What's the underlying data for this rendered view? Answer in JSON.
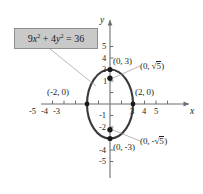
{
  "figure": {
    "type": "graph",
    "equation_box": {
      "text": "9x² + 4y² = 36",
      "coefficient_x": 9,
      "coefficient_y": 4,
      "constant": 36,
      "fill_color": "#c9c9c9",
      "border_color": "#8f8f8f"
    },
    "axes": {
      "x_label": "x",
      "y_label": "y",
      "x_ticks": [
        "-5",
        "-4",
        "-3",
        "3",
        "4",
        "5"
      ],
      "y_ticks_positive": [
        "5",
        "4",
        "2",
        "1"
      ],
      "y_ticks_negative": [
        "-1",
        "-2",
        "-4",
        "-5"
      ],
      "x_range": [
        -5.8,
        5.8
      ],
      "y_range": [
        -5.8,
        5.8
      ],
      "origin_px": [
        110,
        104
      ],
      "unit_px": 11.5,
      "axis_color": "#6d6e71"
    },
    "curve": {
      "shape": "ellipse",
      "semi_axis_x": 2,
      "semi_axis_y": 3,
      "color": "#3a3a3a",
      "line_width": 2.1
    },
    "point_labels": [
      {
        "name": "top-vertex",
        "text": "(0, 3)",
        "x": 0,
        "y": 3
      },
      {
        "name": "bottom-vertex",
        "text": "(0, -3)",
        "x": 0,
        "y": -3
      },
      {
        "name": "left-vertex",
        "text": "(-2, 0)",
        "x": -2,
        "y": 0
      },
      {
        "name": "right-vertex",
        "text": "(2, 0)",
        "x": 2,
        "y": 0
      }
    ],
    "focus_labels": [
      {
        "name": "upper-focus",
        "prefix": "(0, ",
        "radical": "5",
        "suffix": ")",
        "sign": "",
        "x": 0,
        "y": 2.236
      },
      {
        "name": "lower-focus",
        "prefix": "(0, ",
        "radical": "5",
        "suffix": ")",
        "sign": "-",
        "x": 0,
        "y": -2.236
      }
    ],
    "focus_dots": [
      {
        "x": 0,
        "y": 2.236
      },
      {
        "x": 0,
        "y": -2.236
      }
    ],
    "vertex_dots": [
      {
        "x": 0,
        "y": 3
      },
      {
        "x": 0,
        "y": -3
      },
      {
        "x": -2,
        "y": 0
      },
      {
        "x": 2,
        "y": 0
      }
    ]
  }
}
